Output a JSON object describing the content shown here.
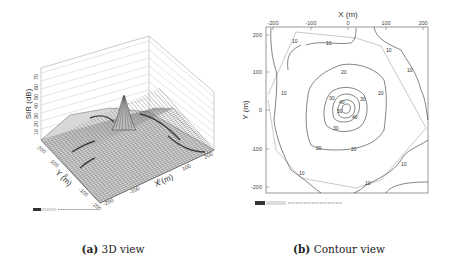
{
  "figure": {
    "panels": [
      {
        "id": "a",
        "caption_label": "(a)",
        "caption_text": "3D view",
        "z_axis_label": "SIR (dB)",
        "x_axis_label": "X (m)",
        "y_axis_label": "Y (m)",
        "z_ticks": [
          "10",
          "20",
          "30",
          "40",
          "50",
          "60",
          "70"
        ],
        "x_ticks": [
          "-200",
          "-100",
          "0",
          "100",
          "200"
        ],
        "y_ticks": [
          "200",
          "100",
          "0",
          "-100",
          "-200"
        ]
      },
      {
        "id": "b",
        "caption_label": "(b)",
        "caption_text": "Contour view",
        "x_axis_label": "X (m)",
        "y_axis_label": "Y (m)",
        "x_ticks": [
          "-200",
          "-100",
          "0",
          "100",
          "200"
        ],
        "y_ticks": [
          "200",
          "100",
          "0",
          "-100",
          "-200"
        ],
        "contour_labels": [
          "10",
          "20",
          "30",
          "40",
          "50",
          "60"
        ]
      }
    ]
  },
  "chart_data": [
    {
      "type": "surface",
      "title": "(a) 3D view",
      "xlabel": "X (m)",
      "ylabel": "Y (m)",
      "zlabel": "SIR (dB)",
      "xlim": [
        -200,
        200
      ],
      "ylim": [
        -200,
        200
      ],
      "zlim": [
        0,
        70
      ],
      "x_ticks": [
        -200,
        -100,
        0,
        100,
        200
      ],
      "y_ticks": [
        -200,
        -100,
        0,
        100,
        200
      ],
      "z_ticks": [
        10,
        20,
        30,
        40,
        50,
        60,
        70
      ],
      "peak": {
        "x": 0,
        "y": 0,
        "z": 45
      },
      "background_level": 10,
      "grid": true
    },
    {
      "type": "contour",
      "title": "(b) Contour view",
      "xlabel": "X (m)",
      "ylabel": "Y (m)",
      "xlim": [
        -200,
        200
      ],
      "ylim": [
        -200,
        200
      ],
      "x_ticks": [
        -200,
        -100,
        0,
        100,
        200
      ],
      "y_ticks": [
        -200,
        -100,
        0,
        100,
        200
      ],
      "x_axis_position": "top",
      "contour_levels": [
        10,
        20,
        30,
        40,
        50,
        60
      ],
      "peak": {
        "x": 0,
        "y": 0
      },
      "legend": "none"
    }
  ]
}
